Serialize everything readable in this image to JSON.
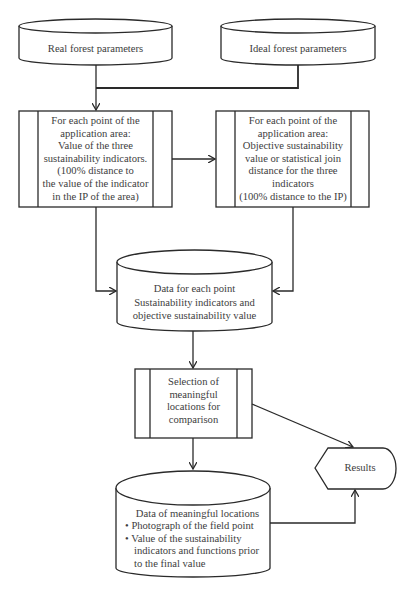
{
  "diagram": {
    "type": "flowchart",
    "nodes": {
      "real_params": {
        "shape": "cylinder",
        "label": "Real forest parameters"
      },
      "ideal_params": {
        "shape": "cylinder",
        "label": "Ideal forest parameters"
      },
      "indicator_values": {
        "shape": "predefined-process",
        "lines": [
          "For each point of the",
          "application area:",
          "Value of the three",
          "sustainability indicators.",
          "(100% distance to",
          "the value of the indicator",
          "in the IP of the area)"
        ]
      },
      "objective_value": {
        "shape": "predefined-process",
        "lines": [
          "For each point of the",
          "application area:",
          "Objective sustainability",
          "value or statistical join",
          "distance for the three",
          "indicators",
          "(100% distance to the IP)"
        ]
      },
      "point_data": {
        "shape": "cylinder",
        "lines": [
          "Data for each point",
          "Sustainability indicators and",
          "objective sustainability value"
        ]
      },
      "selection": {
        "shape": "predefined-process",
        "lines": [
          "Selection of",
          "meaningful",
          "locations for",
          "comparison"
        ]
      },
      "results": {
        "shape": "display",
        "label": "Results"
      },
      "meaningful_data": {
        "shape": "cylinder",
        "title": "Data of meaningful locations",
        "bullets": [
          {
            "marker": "•",
            "text": "Photograph of the field point",
            "cont": ""
          },
          {
            "marker": "•",
            "text": "Value of the sustainability",
            "cont": "indicators and functions prior",
            "cont2": "to the final value"
          }
        ]
      }
    },
    "edges": [
      {
        "from": "real_params",
        "to": "indicator_values"
      },
      {
        "from": "ideal_params",
        "to": "indicator_values"
      },
      {
        "from": "indicator_values",
        "to": "objective_value"
      },
      {
        "from": "indicator_values",
        "to": "point_data"
      },
      {
        "from": "objective_value",
        "to": "point_data"
      },
      {
        "from": "point_data",
        "to": "selection"
      },
      {
        "from": "selection",
        "to": "results"
      },
      {
        "from": "selection",
        "to": "meaningful_data"
      },
      {
        "from": "meaningful_data",
        "to": "results"
      }
    ],
    "colors": {
      "stroke": "#2a2a2a",
      "text": "#3d3d3d",
      "background": "#ffffff"
    }
  }
}
